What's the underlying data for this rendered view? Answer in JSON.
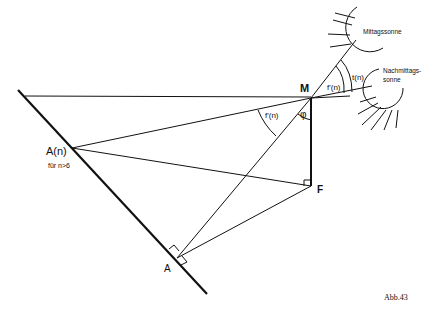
{
  "labels": {
    "M": "M",
    "phi": "φ",
    "F": "F",
    "A": "A",
    "An": "A(n)",
    "An_note": "für n>6",
    "fprime_left": "f'(n)",
    "fprime_right": "f'(n)",
    "tn": "t(n)",
    "sun_noon": "Mittagssonne",
    "sun_afternoon_1": "Nachmittags-",
    "sun_afternoon_2": "sonne",
    "caption": "Abb.43"
  },
  "colors": {
    "line": "#111111",
    "background": "#ffffff"
  }
}
